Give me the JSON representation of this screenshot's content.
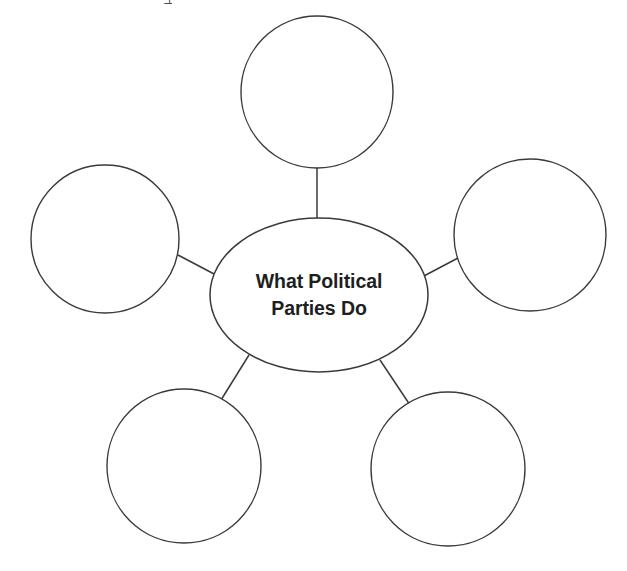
{
  "diagram": {
    "type": "concept-web",
    "title": "What Political Parties Do",
    "center": {
      "label_line_1": "What Political",
      "label_line_2": "Parties Do",
      "shape": "ellipse",
      "cx": 319,
      "cy": 295,
      "rx": 109,
      "ry": 77
    },
    "style": {
      "stroke_color": "#3a3a3a",
      "fill_color": "#ffffff",
      "background_color": "#ffffff",
      "stroke_width": "1.4"
    },
    "satellites": [
      {
        "id": "top",
        "label": "",
        "cx": 317,
        "cy": 92,
        "r": 76
      },
      {
        "id": "top-left",
        "label": "",
        "cx": 105,
        "cy": 239,
        "r": 74
      },
      {
        "id": "top-right",
        "label": "",
        "cx": 530,
        "cy": 235,
        "r": 76
      },
      {
        "id": "bottom-left",
        "label": "",
        "cx": 184,
        "cy": 466,
        "r": 77
      },
      {
        "id": "bottom-right",
        "label": "",
        "cx": 448,
        "cy": 469,
        "r": 77
      }
    ],
    "connectors": [
      {
        "id": "center-to-top",
        "x1": 317,
        "y1": 167,
        "x2": 317,
        "y2": 219
      },
      {
        "id": "center-to-top-left",
        "x1": 179,
        "y1": 256,
        "x2": 214,
        "y2": 274
      },
      {
        "id": "center-to-top-right",
        "x1": 424,
        "y1": 276,
        "x2": 457,
        "y2": 259
      },
      {
        "id": "center-to-bottom-left",
        "x1": 248,
        "y1": 357,
        "x2": 222,
        "y2": 399
      },
      {
        "id": "center-to-bottom-right",
        "x1": 381,
        "y1": 362,
        "x2": 409,
        "y2": 404
      }
    ],
    "artifacts": {
      "top_glyph_fragment": "⊥"
    }
  }
}
